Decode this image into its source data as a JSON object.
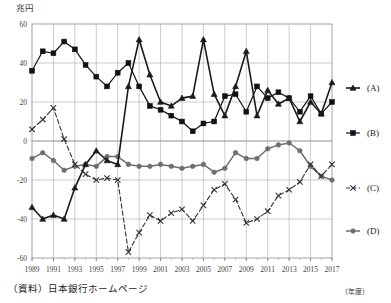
{
  "unit_label": "兆円",
  "x_unit_label": "（年度）",
  "source_note": "（資料）日本銀行ホームページ",
  "chart_data": {
    "type": "line",
    "title": "",
    "subtitle": "",
    "xlabel": "（年度）",
    "ylabel": "兆円",
    "ylim": [
      -60,
      60
    ],
    "xlim": [
      1989,
      2017
    ],
    "grid": true,
    "legend_position": "right",
    "ytick_labels": [
      "60",
      "40",
      "20",
      "0",
      "-20",
      "-40",
      "-60"
    ],
    "ytick_values": [
      60,
      40,
      20,
      0,
      -20,
      -40,
      -60
    ],
    "xtick_labels": [
      "1989",
      "1991",
      "1993",
      "1995",
      "1997",
      "1999",
      "2001",
      "2003",
      "2005",
      "2007",
      "2009",
      "2011",
      "2013",
      "2015",
      "2017"
    ],
    "xtick_values": [
      1989,
      1991,
      1993,
      1995,
      1997,
      1999,
      2001,
      2003,
      2005,
      2007,
      2009,
      2011,
      2013,
      2015,
      2017
    ],
    "x": [
      1989,
      1990,
      1991,
      1992,
      1993,
      1994,
      1995,
      1996,
      1997,
      1998,
      1999,
      2000,
      2001,
      2002,
      2003,
      2004,
      2005,
      2006,
      2007,
      2008,
      2009,
      2010,
      2011,
      2012,
      2013,
      2014,
      2015,
      2016,
      2017
    ],
    "series": [
      {
        "name": "(A)",
        "key": "A",
        "marker": "triangle",
        "line_style": "solid",
        "color": "#1a1a1a",
        "values": [
          -34,
          -40,
          -38,
          -40,
          -24,
          -12,
          -5,
          -10,
          -12,
          28,
          52,
          34,
          20,
          18,
          22,
          23,
          52,
          24,
          13,
          28,
          46,
          13,
          26,
          19,
          22,
          10,
          20,
          14,
          30
        ]
      },
      {
        "name": "(B)",
        "key": "B",
        "marker": "square",
        "line_style": "solid",
        "color": "#111111",
        "values": [
          36,
          46,
          45,
          51,
          47,
          39,
          33,
          28,
          35,
          40,
          28,
          18,
          16,
          13,
          10,
          5,
          9,
          10,
          23,
          24,
          15,
          28,
          22,
          25,
          22,
          15,
          23,
          14,
          20
        ]
      },
      {
        "name": "(C)",
        "key": "C",
        "marker": "x",
        "line_style": "dashed",
        "color": "#333333",
        "values": [
          6,
          11,
          17,
          1,
          -12,
          -17,
          -20,
          -19,
          -20,
          -57,
          -47,
          -38,
          -41,
          -37,
          -35,
          -41,
          -33,
          -25,
          -22,
          -30,
          -42,
          -40,
          -36,
          -28,
          -25,
          -21,
          -12,
          -18,
          -12
        ]
      },
      {
        "name": "(D)",
        "key": "D",
        "marker": "circle",
        "line_style": "solid",
        "color": "#6e6e6e",
        "values": [
          -9,
          -6,
          -10,
          -15,
          -13,
          -12,
          -13,
          -8,
          -8,
          -12,
          -13,
          -13,
          -12,
          -13,
          -14,
          -13,
          -12,
          -16,
          -14,
          -6,
          -9,
          -9,
          -4,
          -2,
          -1,
          -5,
          -13,
          -18,
          -20
        ]
      }
    ]
  },
  "legend": {
    "items": [
      {
        "label": "(A)"
      },
      {
        "label": "(B)"
      },
      {
        "label": "(C)"
      },
      {
        "label": "(D)"
      }
    ]
  }
}
